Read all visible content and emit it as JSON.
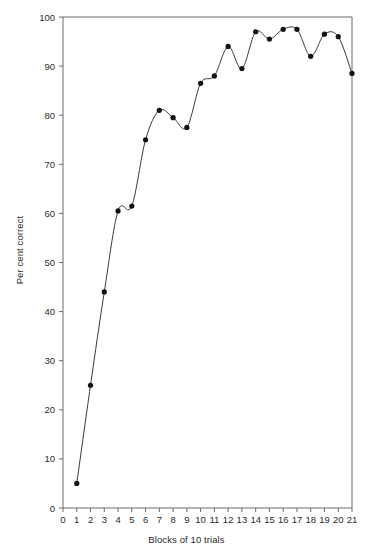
{
  "chart_data": {
    "type": "line",
    "title": "",
    "subtitle": "",
    "xlabel": "Blocks of 10 trials",
    "ylabel": "Per cent correct",
    "xlim": [
      0,
      21
    ],
    "ylim": [
      0,
      100
    ],
    "grid": false,
    "legend": null,
    "marker": "filled-circle",
    "x_ticks": [
      0,
      1,
      2,
      3,
      4,
      5,
      6,
      7,
      8,
      9,
      10,
      11,
      12,
      13,
      14,
      15,
      16,
      17,
      18,
      19,
      20,
      21
    ],
    "y_ticks": [
      0,
      10,
      20,
      30,
      40,
      50,
      60,
      70,
      80,
      90,
      100
    ],
    "x": [
      1,
      2,
      3,
      4,
      5,
      6,
      7,
      8,
      9,
      10,
      11,
      12,
      13,
      14,
      15,
      16,
      17,
      18,
      19,
      20,
      21
    ],
    "values": [
      5,
      25,
      44,
      60.5,
      61.5,
      75,
      81,
      79.5,
      77.5,
      86.5,
      88,
      94,
      89.5,
      97,
      95.5,
      97.5,
      97.5,
      92,
      96.5,
      96,
      88.5
    ],
    "series": [
      {
        "name": "Per cent correct",
        "values": [
          5,
          25,
          44,
          60.5,
          61.5,
          75,
          81,
          79.5,
          77.5,
          86.5,
          88,
          94,
          89.5,
          97,
          95.5,
          97.5,
          97.5,
          92,
          96.5,
          96,
          88.5
        ]
      }
    ],
    "colors": {
      "line": "#3a3a3a",
      "marker": "#111111",
      "axis": "#6b6b6b",
      "text": "#2b2b2b",
      "background": "#ffffff"
    }
  }
}
